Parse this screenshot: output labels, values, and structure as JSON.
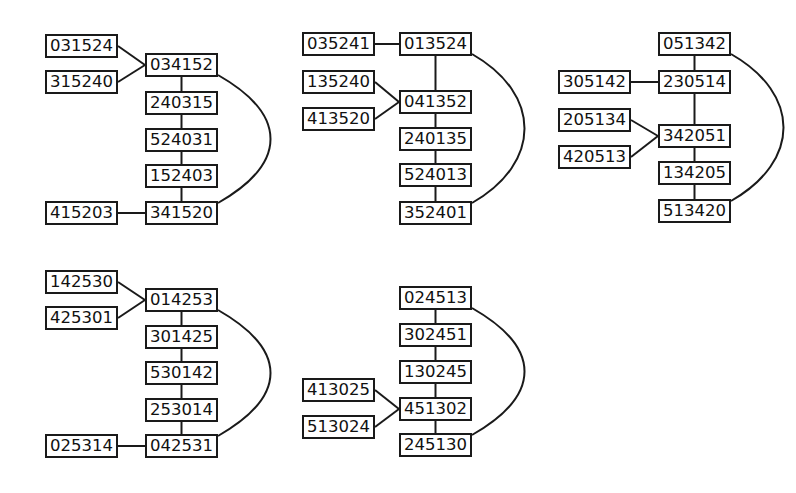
{
  "diagrams": [
    {
      "id": "g1",
      "chain": [
        {
          "label": "034152",
          "x": 145,
          "y": 53
        },
        {
          "label": "240315",
          "x": 145,
          "y": 91
        },
        {
          "label": "524031",
          "x": 145,
          "y": 128
        },
        {
          "label": "152403",
          "x": 145,
          "y": 164
        },
        {
          "label": "341520",
          "x": 145,
          "y": 201
        }
      ],
      "leaves": [
        {
          "label": "031524",
          "x": 45,
          "y": 34,
          "attach": 0
        },
        {
          "label": "315240",
          "x": 45,
          "y": 70,
          "attach": 0
        },
        {
          "label": "415203",
          "x": 45,
          "y": 201,
          "attach": 4
        }
      ]
    },
    {
      "id": "g2",
      "chain": [
        {
          "label": "013524",
          "x": 399,
          "y": 32
        },
        {
          "label": "041352",
          "x": 399,
          "y": 90
        },
        {
          "label": "240135",
          "x": 399,
          "y": 127
        },
        {
          "label": "524013",
          "x": 399,
          "y": 163
        },
        {
          "label": "352401",
          "x": 399,
          "y": 201
        }
      ],
      "leaves": [
        {
          "label": "035241",
          "x": 302,
          "y": 32,
          "attach": 0
        },
        {
          "label": "135240",
          "x": 302,
          "y": 70,
          "attach": 1
        },
        {
          "label": "413520",
          "x": 302,
          "y": 107,
          "attach": 1
        }
      ]
    },
    {
      "id": "g3",
      "chain": [
        {
          "label": "051342",
          "x": 658,
          "y": 32
        },
        {
          "label": "230514",
          "x": 658,
          "y": 70
        },
        {
          "label": "342051",
          "x": 658,
          "y": 124
        },
        {
          "label": "134205",
          "x": 658,
          "y": 161
        },
        {
          "label": "513420",
          "x": 658,
          "y": 199
        }
      ],
      "leaves": [
        {
          "label": "305142",
          "x": 558,
          "y": 70,
          "attach": 1
        },
        {
          "label": "205134",
          "x": 558,
          "y": 108,
          "attach": 2
        },
        {
          "label": "420513",
          "x": 558,
          "y": 145,
          "attach": 2
        }
      ]
    },
    {
      "id": "g4",
      "chain": [
        {
          "label": "014253",
          "x": 145,
          "y": 288
        },
        {
          "label": "301425",
          "x": 145,
          "y": 325
        },
        {
          "label": "530142",
          "x": 145,
          "y": 361
        },
        {
          "label": "253014",
          "x": 145,
          "y": 398
        },
        {
          "label": "042531",
          "x": 145,
          "y": 434
        }
      ],
      "leaves": [
        {
          "label": "142530",
          "x": 45,
          "y": 270,
          "attach": 0
        },
        {
          "label": "425301",
          "x": 45,
          "y": 306,
          "attach": 0
        },
        {
          "label": "025314",
          "x": 45,
          "y": 434,
          "attach": 4
        }
      ]
    },
    {
      "id": "g5",
      "chain": [
        {
          "label": "024513",
          "x": 399,
          "y": 286
        },
        {
          "label": "302451",
          "x": 399,
          "y": 323
        },
        {
          "label": "130245",
          "x": 399,
          "y": 360
        },
        {
          "label": "451302",
          "x": 399,
          "y": 397
        },
        {
          "label": "245130",
          "x": 399,
          "y": 433
        }
      ],
      "leaves": [
        {
          "label": "413025",
          "x": 302,
          "y": 378,
          "attach": 3
        },
        {
          "label": "513024",
          "x": 302,
          "y": 415,
          "attach": 3
        }
      ]
    }
  ]
}
